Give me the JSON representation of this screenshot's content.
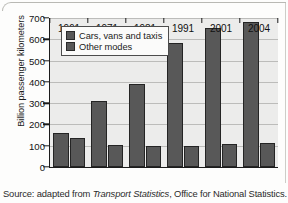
{
  "figure": {
    "source_prefix": "Source: adapted from ",
    "source_italic": "Transport Statistics",
    "source_suffix": ", Office for National Statistics."
  },
  "chart_data": {
    "type": "bar",
    "title": "",
    "xlabel": "",
    "ylabel": "Billion passenger kilometers",
    "categories": [
      "1961",
      "1971",
      "1981",
      "1991",
      "2001",
      "2004"
    ],
    "ylim": [
      0,
      700
    ],
    "yticks": [
      "0",
      "100",
      "200",
      "300",
      "400",
      "500",
      "600",
      "700"
    ],
    "grid": true,
    "legend_position": "top-left",
    "series": [
      {
        "name": "Cars, vans and taxis",
        "color": "#585858",
        "values": [
          160,
          310,
          392,
          582,
          652,
          680
        ]
      },
      {
        "name": "Other modes",
        "color": "#585858",
        "values": [
          135,
          105,
          98,
          97,
          107,
          115
        ]
      }
    ]
  }
}
